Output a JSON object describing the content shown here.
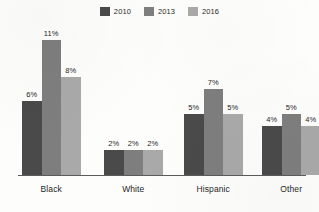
{
  "chart_data": {
    "type": "bar",
    "title": "",
    "subtitle": "",
    "xlabel": "",
    "ylabel": "",
    "categories": [
      "Black",
      "White",
      "Hispanic",
      "Other"
    ],
    "series": [
      {
        "name": "2010",
        "color": "#4a4a4a",
        "values": [
          6,
          11,
          5,
          4
        ],
        "labels": [
          "6%",
          "11%",
          "5%",
          "4%"
        ]
      },
      {
        "name": "2013",
        "color": "#7e7e7e",
        "values": [
          11,
          2,
          7,
          5
        ],
        "labels": [
          "11%",
          "2%",
          "7%",
          "5%"
        ]
      },
      {
        "name": "2016",
        "color": "#a9a9a9",
        "values": [
          8,
          2,
          5,
          4
        ],
        "labels": [
          "8%",
          "2%",
          "5%",
          "4%"
        ]
      }
    ],
    "grouped_values": [
      {
        "category": "Black",
        "bars": [
          {
            "series": "2010",
            "value": 6,
            "label": "6%"
          },
          {
            "series": "2013",
            "value": 11,
            "label": "11%"
          },
          {
            "series": "2016",
            "value": 8,
            "label": "8%"
          }
        ]
      },
      {
        "category": "White",
        "bars": [
          {
            "series": "2010",
            "value": 2,
            "label": "2%"
          },
          {
            "series": "2013",
            "value": 2,
            "label": "2%"
          },
          {
            "series": "2016",
            "value": 2,
            "label": "2%"
          }
        ]
      },
      {
        "category": "Hispanic",
        "bars": [
          {
            "series": "2010",
            "value": 5,
            "label": "5%"
          },
          {
            "series": "2013",
            "value": 7,
            "label": "7%"
          },
          {
            "series": "2016",
            "value": 5,
            "label": "5%"
          }
        ]
      },
      {
        "category": "Other",
        "bars": [
          {
            "series": "2010",
            "value": 4,
            "label": "4%"
          },
          {
            "series": "2013",
            "value": 5,
            "label": "5%"
          },
          {
            "series": "2016",
            "value": 4,
            "label": "4%"
          }
        ]
      }
    ],
    "ylim": [
      0,
      11
    ],
    "grid": false,
    "legend_position": "top-center",
    "value_labels_shown": true,
    "axis_color": "#5b5b5b",
    "background_color": "#fdfdfb"
  },
  "legend": {
    "entries": [
      {
        "label": "2010",
        "color": "#4a4a4a"
      },
      {
        "label": "2013",
        "color": "#7e7e7e"
      },
      {
        "label": "2016",
        "color": "#a9a9a9"
      }
    ]
  },
  "axis": {
    "categories": [
      "Black",
      "White",
      "Hispanic",
      "Other"
    ]
  }
}
